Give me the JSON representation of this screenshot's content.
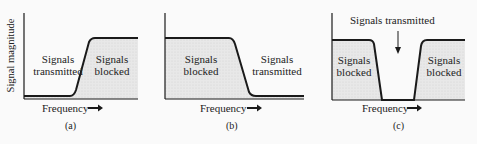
{
  "figure": {
    "y_axis_label": "Signal magnitude",
    "panels": [
      {
        "id": "a",
        "caption": "(a)",
        "x_label": "Frequency",
        "region_left": "Signals\ntransmitted",
        "region_right": "Signals\nblocked",
        "filter_type": "low-pass"
      },
      {
        "id": "b",
        "caption": "(b)",
        "x_label": "Frequency",
        "region_left": "Signals\nblocked",
        "region_right": "Signals\ntransmitted",
        "filter_type": "high-pass"
      },
      {
        "id": "c",
        "caption": "(c)",
        "x_label": "Frequency",
        "region_left": "Signals\nblocked",
        "region_right": "Signals\nblocked",
        "annotation": "Signals transmitted",
        "filter_type": "band-pass"
      }
    ],
    "colors": {
      "curve": "#1a1a1a",
      "fill": "#e6e6e6",
      "axis": "#1a1a1a"
    }
  }
}
